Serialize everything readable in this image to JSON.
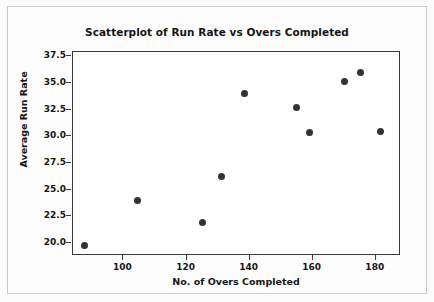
{
  "chart_data": {
    "type": "scatter",
    "title": "Scatterplot of Run Rate vs Overs Completed",
    "xlabel": "No. of Overs Completed",
    "ylabel": "Average Run Rate",
    "xlim": [
      84,
      188
    ],
    "ylim": [
      18.8,
      37.9
    ],
    "xticks": [
      100,
      120,
      140,
      160,
      180
    ],
    "xtick_labels": [
      "100",
      "120",
      "140",
      "160",
      "180"
    ],
    "yticks": [
      20.0,
      22.5,
      25.0,
      27.5,
      30.0,
      32.5,
      35.0,
      37.5
    ],
    "ytick_labels": [
      "20.0",
      "22.5",
      "25.0",
      "27.5",
      "30.0",
      "32.5",
      "35.0",
      "37.5"
    ],
    "grid": false,
    "legend": null,
    "marker": "filled-circle",
    "marker_color": "#333333",
    "x": [
      87.5,
      104.5,
      125.0,
      131.0,
      138.5,
      155.0,
      159.0,
      170.0,
      175.0,
      181.5
    ],
    "y": [
      19.8,
      24.0,
      21.9,
      26.2,
      34.0,
      32.7,
      30.4,
      35.1,
      36.0,
      30.5
    ],
    "points": [
      {
        "x": 87.5,
        "y": 19.8
      },
      {
        "x": 104.5,
        "y": 24.0
      },
      {
        "x": 125.0,
        "y": 21.9
      },
      {
        "x": 131.0,
        "y": 26.2
      },
      {
        "x": 138.5,
        "y": 34.0
      },
      {
        "x": 155.0,
        "y": 32.7
      },
      {
        "x": 159.0,
        "y": 30.4
      },
      {
        "x": 170.0,
        "y": 35.1
      },
      {
        "x": 175.0,
        "y": 36.0
      },
      {
        "x": 181.5,
        "y": 30.5
      }
    ]
  },
  "colors": {
    "marker": "#333333",
    "axis": "#3a3a3a",
    "text": "#161616",
    "plot_background": "#ffffff",
    "figure_background": "#fdfdfd",
    "figure_border": "#c8c8c8"
  }
}
